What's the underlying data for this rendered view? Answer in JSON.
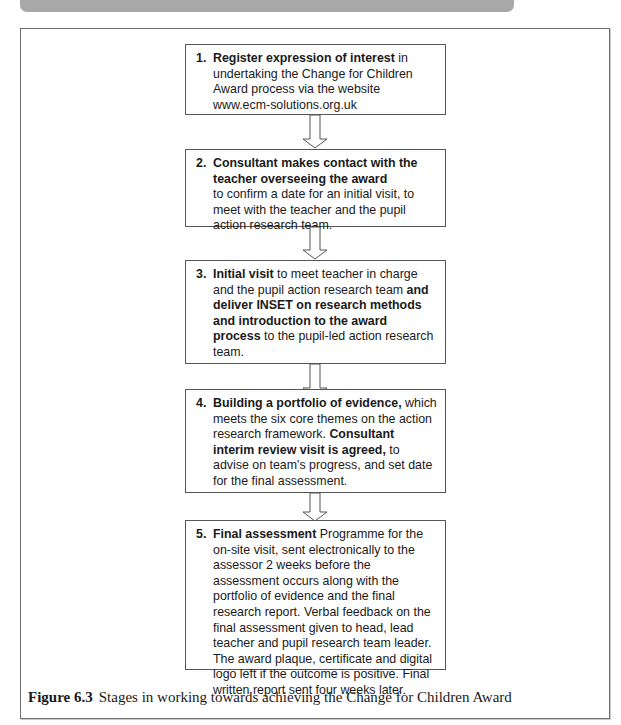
{
  "header": {
    "text": "THE CHANGE FOR CHILDREN AWARD"
  },
  "diagram": {
    "type": "flowchart",
    "direction": "top-to-bottom",
    "steps": [
      {
        "number": "1.",
        "bold": "Register expression of interest",
        "text": " in undertaking the Change for Children Award process via the website www.ecm-solutions.org.uk"
      },
      {
        "number": "2.",
        "bold": "Consultant makes contact with the teacher overseeing the award",
        "text": "to confirm a date for an initial visit, to meet with the teacher and the pupil action research team."
      },
      {
        "number": "3.",
        "bold": "Initial visit",
        "text": " to meet teacher in charge and the pupil action research team ",
        "bold2": "and deliver INSET on research methods and introduction to the award process",
        "text2": " to the pupil-led action research team."
      },
      {
        "number": "4.",
        "bold": "Building a portfolio of evidence,",
        "text": " which meets the six core themes on the action research framework. ",
        "bold2": "Consultant interim review visit is agreed,",
        "text2": " to advise on team's progress, and set date for the final assessment."
      },
      {
        "number": "5.",
        "bold": "Final assessment",
        "text": " Programme for the on-site visit, sent electronically to the assessor 2 weeks before the assessment occurs along with the portfolio of evidence and the final research report. Verbal feedback on the final assessment given to head, lead teacher and pupil research team leader. The award plaque, certificate and digital logo left if the outcome is positive. Final written report sent four weeks later."
      }
    ],
    "arrow_icon": "hollow-down-arrow"
  },
  "caption": {
    "label": "Figure 6.3",
    "text": "Stages in working towards achieving the Change for Children Award"
  },
  "colors": {
    "box_border": "#555555",
    "frame_border": "#6e6e6e",
    "header_bar": "#a8a8a8",
    "text": "#1a1a1a"
  }
}
